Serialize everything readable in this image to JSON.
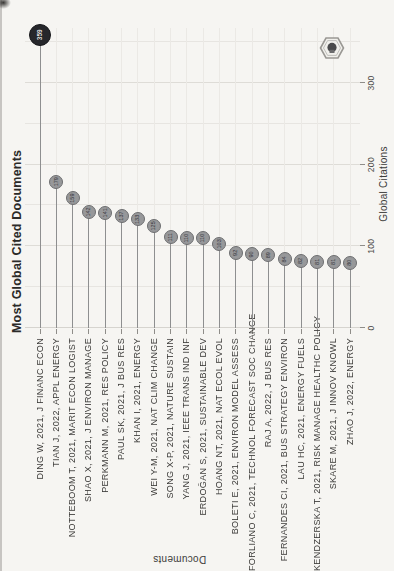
{
  "chart_data": {
    "type": "scatter",
    "variant": "horizontal lollipop (point + stem), rendered landscape then rotated 90° CCW on the page",
    "title": "Most Global Cited Documents",
    "xlabel": "Global Citations",
    "ylabel": "Documents",
    "xlim": [
      0,
      375
    ],
    "xticks": [
      0,
      100,
      200,
      300
    ],
    "grid": true,
    "gridline_step": 50,
    "legend": "none",
    "categories": [
      "DING W, 2021, J FINANC ECON",
      "TIAN J, 2022, APPL ENERGY",
      "NOTTEBOOM T, 2021, MARIT ECON LOGIST",
      "SHAO X, 2021, J ENVIRON MANAGE",
      "PERKMANN M, 2021, RES POLICY",
      "PAUL SK, 2021, J BUS RES",
      "KHAN I, 2021, ENERGY",
      "WEI Y-M, 2021, NAT CLIM CHANGE",
      "SONG X-P, 2021, NATURE SUSTAIN",
      "YANG J, 2021, IEEE TRANS IND INF",
      "ERDOĞAN S, 2021, SUSTAINABLE DEV",
      "HOANG NT, 2021, NAT ECOL EVOL",
      "BOLETI E, 2021, ENVIRON MODEL ASSESS",
      "FORLIANO C, 2021, TECHNOL FORECAST SOC CHANGE",
      "RAJ A, 2022, J BUS RES",
      "FERNANDES CI, 2021, BUS STRATEGY ENVIRON",
      "LAU HC, 2021, ENERGY FUELS",
      "KENDZERSKA T, 2021, RISK MANAGE HEALTHC POLICY",
      "SKARE M, 2021, J INNOV KNOWL",
      "ZHAO J, 2022, ENERGY"
    ],
    "values": [
      359,
      179,
      159,
      142,
      141,
      137,
      133,
      125,
      111,
      110,
      110,
      103,
      92,
      90,
      89,
      84,
      82,
      81,
      81,
      80
    ],
    "values_note": "first point labeled 359 in-dot; remaining in-dot numbers illegible in scan, estimated from axis",
    "point_labels_inside_dots": true,
    "first_point_highlighted_dark": true
  },
  "logo": {
    "name": "hexagon-logo",
    "shape": "hexagon outline with dark emblem inside"
  },
  "colors": {
    "paper": "#f6f5f2",
    "grid": "#e7e5e1",
    "grid_major": "#dedcd7",
    "stem": "#8e8f90",
    "dot_fill": "#97989a",
    "dot_border": "#6d6e70",
    "dot_first_fill": "#26272b",
    "dot_first_text": "#dddddd",
    "text": "#3c3b39",
    "title_text": "#2b2a28"
  }
}
